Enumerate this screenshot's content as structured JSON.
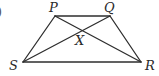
{
  "figure": {
    "type": "trapezium",
    "partial_marker": ")",
    "vertices": {
      "P": {
        "label": "P",
        "x": 55,
        "y": 16
      },
      "Q": {
        "label": "Q",
        "x": 110,
        "y": 16
      },
      "R": {
        "label": "R",
        "x": 141,
        "y": 62
      },
      "S": {
        "label": "S",
        "x": 23,
        "y": 62
      }
    },
    "intersection": {
      "label": "X",
      "x": 81,
      "y": 31
    },
    "edges": [
      [
        "P",
        "Q"
      ],
      [
        "Q",
        "R"
      ],
      [
        "R",
        "S"
      ],
      [
        "S",
        "P"
      ]
    ],
    "diagonals": [
      [
        "P",
        "R"
      ],
      [
        "Q",
        "S"
      ]
    ],
    "line_color": "#2e2e2e"
  }
}
